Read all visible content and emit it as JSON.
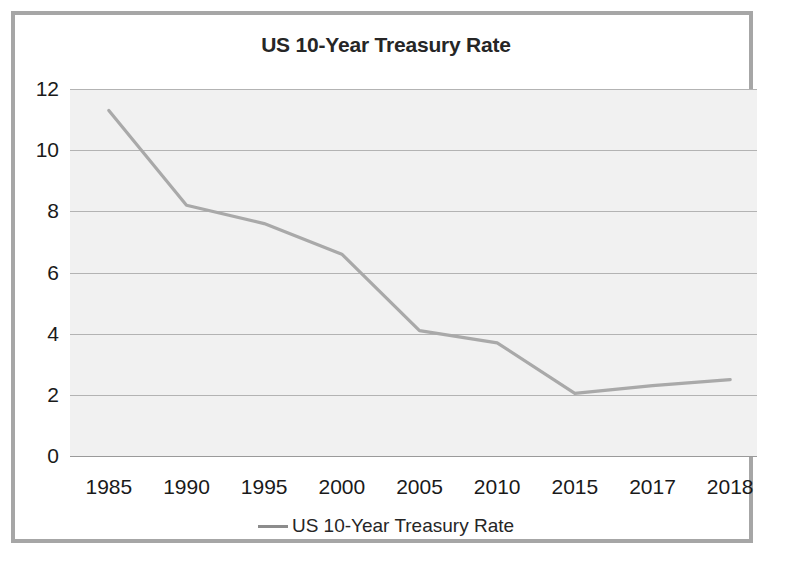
{
  "chart": {
    "title": "US 10-Year Treasury Rate"
  },
  "legend": {
    "swatch_name": "line-swatch",
    "label": "US 10-Year Treasury Rate",
    "color": "#8c8c8c",
    "position": "bottom-center"
  },
  "colors": {
    "series_line": "#8c8c8c",
    "plot_background": "#ececec",
    "gridline": "#9a9a9a",
    "frame_border": "#a6a6a6",
    "text": "#1a1a1a",
    "title_text": "#262626"
  },
  "chart_data": {
    "type": "line",
    "title": "US 10-Year Treasury Rate",
    "xlabel": "",
    "ylabel": "",
    "categories": [
      "1985",
      "1990",
      "1995",
      "2000",
      "2005",
      "2010",
      "2015",
      "2017",
      "2018"
    ],
    "values": [
      11.3,
      8.2,
      7.6,
      6.6,
      4.1,
      3.7,
      2.05,
      2.3,
      2.5
    ],
    "series": [
      {
        "name": "US 10-Year Treasury Rate",
        "color": "#8c8c8c",
        "values": [
          11.3,
          8.2,
          7.6,
          6.6,
          4.1,
          3.7,
          2.05,
          2.3,
          2.5
        ]
      }
    ],
    "ylim": [
      0,
      12
    ],
    "yticks": [
      0,
      2,
      4,
      6,
      8,
      10,
      12
    ],
    "ytick_labels": [
      "0",
      "2",
      "4",
      "6",
      "8",
      "10",
      "12"
    ],
    "xtick_labels": [
      "1985",
      "1990",
      "1995",
      "2000",
      "2005",
      "2010",
      "2015",
      "2017",
      "2018"
    ],
    "grid": "horizontal",
    "legend_position": "bottom",
    "markers": false
  }
}
